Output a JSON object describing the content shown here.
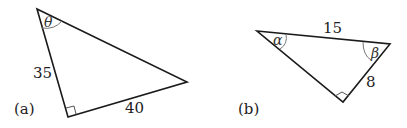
{
  "figures": [
    {
      "id": "a",
      "caption": "(a)",
      "angle_label": "θ",
      "side_labels": {
        "vertical_leg": "35",
        "bottom_leg": "40"
      },
      "right_angle": true
    },
    {
      "id": "b",
      "caption": "(b)",
      "angle_labels": {
        "left": "α",
        "right": "β"
      },
      "side_labels": {
        "hypotenuse": "15",
        "short_leg": "8"
      },
      "right_angle": true
    }
  ],
  "colors": {
    "stroke": "#1a1a1a",
    "arc": "#777777",
    "text": "#222222"
  }
}
